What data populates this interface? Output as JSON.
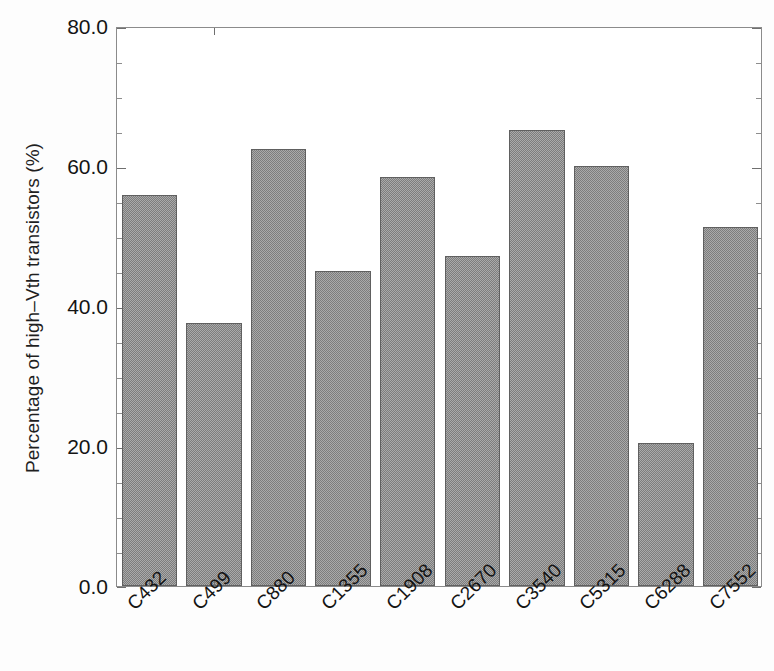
{
  "chart_data": {
    "type": "bar",
    "title": "",
    "xlabel": "",
    "ylabel": "Percentage of high–Vth transistors (%)",
    "categories": [
      "C432",
      "C499",
      "C880",
      "C1355",
      "C1908",
      "C2670",
      "C3540",
      "C5315",
      "C6288",
      "C7552"
    ],
    "values": [
      55.8,
      37.6,
      62.5,
      45.0,
      58.5,
      47.2,
      65.2,
      60.0,
      20.5,
      51.3
    ],
    "ylim": [
      0.0,
      80.0
    ],
    "ytick_labels": [
      "0.0",
      "20.0",
      "40.0",
      "60.0",
      "80.0"
    ],
    "ytick_values": [
      0.0,
      20.0,
      40.0,
      60.0,
      80.0
    ],
    "y_minor_interval": 5.0,
    "grid": false,
    "legend": null,
    "bar_color": "#7d7d7d",
    "bar_edge_color": "#606060",
    "axis_color": "#8b8b8b",
    "background_color": "#ffffff",
    "xtick_rotation_degrees": -45
  }
}
